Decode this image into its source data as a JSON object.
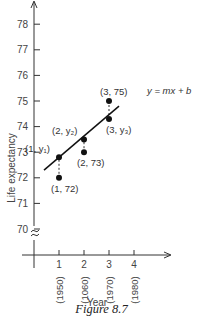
{
  "figure": {
    "caption": "Figure 8.7"
  },
  "chart_data": {
    "type": "scatter",
    "title": "",
    "xlabel": "Year",
    "ylabel": "Life expectancy",
    "x_ticks": [
      {
        "value": 1,
        "label": "1",
        "sublabel": "(1950)"
      },
      {
        "value": 2,
        "label": "2",
        "sublabel": "(1060)"
      },
      {
        "value": 3,
        "label": "3",
        "sublabel": "(1970)"
      },
      {
        "value": 4,
        "label": "4",
        "sublabel": "(1980)"
      }
    ],
    "y_ticks": [
      70,
      71,
      72,
      73,
      74,
      75,
      76,
      77,
      78
    ],
    "ylim": [
      70,
      78
    ],
    "xlim": [
      0,
      4
    ],
    "axis_break": true,
    "grid": false,
    "series": [
      {
        "name": "observed",
        "points": [
          {
            "x": 1,
            "y": 72,
            "label": "(1, 72)"
          },
          {
            "x": 2,
            "y": 73,
            "label": "(2, 73)"
          },
          {
            "x": 3,
            "y": 75,
            "label": "(3, 75)"
          }
        ]
      },
      {
        "name": "fitted",
        "points": [
          {
            "x": 1,
            "y": 72.8,
            "label": "(1, y₁)"
          },
          {
            "x": 2,
            "y": 73.5,
            "label": "(2, y₂)"
          },
          {
            "x": 3,
            "y": 74.3,
            "label": "(3, y₃)"
          }
        ]
      }
    ],
    "line": {
      "label": "y = mx + b",
      "from": {
        "x": 0.4,
        "y": 72.3
      },
      "to": {
        "x": 3.4,
        "y": 74.8
      }
    },
    "residuals": "dashed vertical segments between observed and fitted points"
  }
}
